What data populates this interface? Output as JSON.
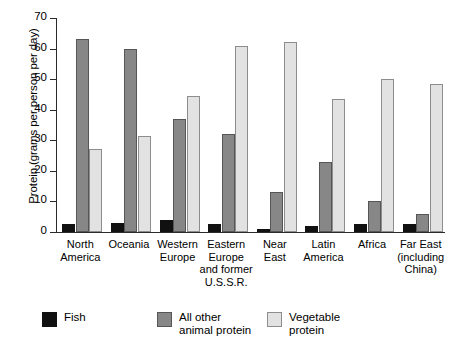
{
  "chart_data": {
    "type": "bar",
    "title": "",
    "xlabel": "",
    "ylabel": "Protein (grams per person per day)",
    "ylim": [
      0,
      70
    ],
    "ytick_labels": [
      "70",
      "60",
      "50",
      "40",
      "30",
      "20",
      "10",
      "0"
    ],
    "ytick_values": [
      70,
      60,
      50,
      40,
      30,
      20,
      10,
      0
    ],
    "grid": false,
    "legend_position": "bottom",
    "categories": [
      "North\nAmerica",
      "Oceania",
      "Western\nEurope",
      "Eastern\nEurope\nand former\nU.S.S.R.",
      "Near\nEast",
      "Latin\nAmerica",
      "Africa",
      "Far East\n(including\nChina)"
    ],
    "series": [
      {
        "name": "Fish",
        "color": "#111111",
        "values": [
          2.5,
          3,
          4,
          2.5,
          1,
          2,
          2.5,
          2.5
        ]
      },
      {
        "name": "All other\nanimal protein",
        "color": "#878787",
        "values": [
          63,
          60,
          37,
          32,
          13,
          23,
          10,
          6
        ]
      },
      {
        "name": "Vegetable\nprotein",
        "color": "#e2e2e2",
        "values": [
          27,
          31.5,
          44.5,
          61,
          62,
          43.5,
          50,
          48.5
        ]
      }
    ]
  },
  "legend": {
    "items": [
      {
        "label": "Fish",
        "swatch": "fish"
      },
      {
        "label": "All other\nanimal protein",
        "swatch": "animal"
      },
      {
        "label": "Vegetable\nprotein",
        "swatch": "veg"
      }
    ]
  }
}
